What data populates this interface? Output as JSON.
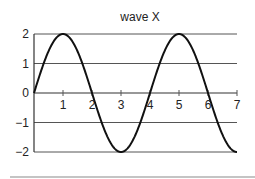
{
  "chart_data": {
    "type": "line",
    "title": "wave X",
    "xlabel": "",
    "ylabel": "",
    "xlim": [
      0,
      7
    ],
    "ylim": [
      -2,
      2
    ],
    "x_ticks": [
      1,
      2,
      3,
      4,
      5,
      6,
      7
    ],
    "x_tick_labels": [
      "1",
      "2",
      "3",
      "4",
      "5",
      "6",
      "7"
    ],
    "y_ticks": [
      2,
      1,
      0,
      -1,
      -2
    ],
    "y_tick_labels": [
      "2",
      "1",
      "0",
      "−1",
      "−2"
    ],
    "grid": "horizontal",
    "legend": null,
    "series": [
      {
        "name": "wave X",
        "function": "y = 2*sin(pi*x/2)",
        "x": [
          0,
          0.5,
          1,
          1.5,
          2,
          2.5,
          3,
          3.5,
          4,
          4.5,
          5,
          5.5,
          6,
          6.5,
          7
        ],
        "values": [
          0,
          1.41,
          2,
          1.41,
          0,
          -1.41,
          -2,
          -1.41,
          0,
          1.41,
          2,
          1.41,
          0,
          -1.41,
          -2
        ],
        "color": "#111111"
      }
    ]
  },
  "colors": {
    "curve": "#111111",
    "grid": "#555555",
    "background": "#ffffff"
  }
}
